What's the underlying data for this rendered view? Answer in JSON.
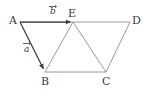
{
  "figure": {
    "background_color": "#ffffff",
    "line_color": "#8a8a8a",
    "vector_color": "#3c3c3c",
    "label_color": "#3a3a3a",
    "points": [
      {
        "id": "A",
        "label": "A",
        "x": 20,
        "y": 22,
        "label_x": 9,
        "label_y": 16
      },
      {
        "id": "E",
        "label": "E",
        "x": 73,
        "y": 22,
        "label_x": 69,
        "label_y": 9
      },
      {
        "id": "D",
        "label": "D",
        "x": 130,
        "y": 22,
        "label_x": 133,
        "label_y": 16
      },
      {
        "id": "B",
        "label": "B",
        "x": 45,
        "y": 72,
        "label_x": 41,
        "label_y": 77
      },
      {
        "id": "C",
        "label": "C",
        "x": 106,
        "y": 72,
        "label_x": 102,
        "label_y": 77
      }
    ],
    "segments": [
      {
        "id": "A-D",
        "from": "A",
        "to": "D",
        "style": "plain"
      },
      {
        "id": "B-C",
        "from": "B",
        "to": "C",
        "style": "plain"
      },
      {
        "id": "E-B",
        "from": "E",
        "to": "B",
        "style": "plain"
      },
      {
        "id": "E-C",
        "from": "E",
        "to": "C",
        "style": "plain"
      },
      {
        "id": "C-D",
        "from": "C",
        "to": "D",
        "style": "plain"
      }
    ],
    "vectors": [
      {
        "id": "b",
        "label": "b",
        "from": "A",
        "to": "E",
        "label_x": 49,
        "label_y": 7,
        "bar_x": 49,
        "bar_y": 5,
        "bar_w": 8
      },
      {
        "id": "a",
        "label": "a",
        "from": "A",
        "to": "B",
        "label_x": 24,
        "label_y": 48,
        "bar_x": 24,
        "bar_y": 42,
        "bar_w": 8
      }
    ]
  }
}
